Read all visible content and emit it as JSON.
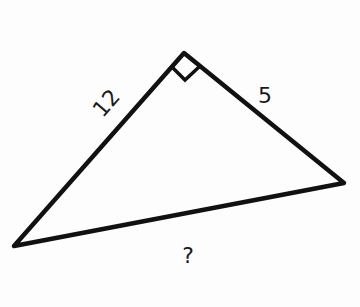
{
  "figure": {
    "type": "right-triangle",
    "labels": {
      "leg_left": "12",
      "leg_right": "5",
      "hypotenuse": "?"
    },
    "right_angle_marker": true,
    "stroke_color": "#111111"
  }
}
